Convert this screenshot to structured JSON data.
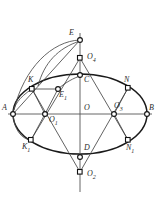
{
  "figure": {
    "background_color": "#ffffff",
    "stroke_color": "#1a1a1a",
    "width": 160,
    "height": 199,
    "center": {
      "x": 80,
      "y": 114
    },
    "ellipse": {
      "cx": 80,
      "cy": 114,
      "rx": 67,
      "ry": 40
    },
    "points": [
      {
        "id": "A",
        "label": "A",
        "sub": "",
        "x": 13,
        "y": 114,
        "marker": "circle",
        "label_x": 2,
        "label_y": 104
      },
      {
        "id": "B",
        "label": "B",
        "sub": "",
        "x": 147,
        "y": 114,
        "marker": "circle",
        "label_x": 149,
        "label_y": 104
      },
      {
        "id": "C",
        "label": "C",
        "sub": "",
        "x": 80,
        "y": 75,
        "marker": "circle",
        "label_x": 84,
        "label_y": 76
      },
      {
        "id": "D",
        "label": "D",
        "sub": "",
        "x": 80,
        "y": 157,
        "marker": "circle",
        "label_x": 84,
        "label_y": 144
      },
      {
        "id": "E",
        "label": "E",
        "sub": "",
        "x": 80,
        "y": 40,
        "marker": "circle",
        "label_x": 69,
        "label_y": 29
      },
      {
        "id": "E1",
        "label": "E",
        "sub": "1",
        "x": 58,
        "y": 89,
        "marker": "circle",
        "label_x": 59,
        "label_y": 91
      },
      {
        "id": "K",
        "label": "K",
        "sub": "",
        "x": 32,
        "y": 89,
        "marker": "square",
        "label_x": 28,
        "label_y": 76
      },
      {
        "id": "K1",
        "label": "K",
        "sub": "1",
        "x": 31,
        "y": 140,
        "marker": "square",
        "label_x": 22,
        "label_y": 143
      },
      {
        "id": "N",
        "label": "N",
        "sub": "",
        "x": 128,
        "y": 88,
        "marker": "square",
        "label_x": 124,
        "label_y": 76
      },
      {
        "id": "N1",
        "label": "N",
        "sub": "1",
        "x": 128,
        "y": 140,
        "marker": "square",
        "label_x": 126,
        "label_y": 144
      },
      {
        "id": "O",
        "label": "O",
        "sub": "",
        "x": 80,
        "y": 114,
        "marker": "none",
        "label_x": 84,
        "label_y": 104
      },
      {
        "id": "O1",
        "label": "O",
        "sub": "1",
        "x": 45,
        "y": 114,
        "marker": "circle",
        "label_x": 49,
        "label_y": 116
      },
      {
        "id": "O2",
        "label": "O",
        "sub": "2",
        "x": 80,
        "y": 172,
        "marker": "square",
        "label_x": 87,
        "label_y": 170
      },
      {
        "id": "O3",
        "label": "O",
        "sub": "3",
        "x": 114,
        "y": 114,
        "marker": "circle",
        "label_x": 114,
        "label_y": 102
      },
      {
        "id": "O4",
        "label": "O",
        "sub": "4",
        "x": 80,
        "y": 58,
        "marker": "square",
        "label_x": 87,
        "label_y": 53
      }
    ],
    "axes": [
      {
        "name": "major-axis",
        "x1": 8,
        "y1": 114,
        "x2": 152,
        "y2": 114
      },
      {
        "name": "minor-axis",
        "x1": 80,
        "y1": 33,
        "x2": 80,
        "y2": 192
      }
    ],
    "chords": [
      {
        "name": "A-to-E",
        "x1": 13,
        "y1": 114,
        "x2": 80,
        "y2": 40
      },
      {
        "name": "O4-to-K1",
        "x1": 80,
        "y1": 58,
        "x2": 31,
        "y2": 140
      },
      {
        "name": "O4-to-N1",
        "x1": 80,
        "y1": 58,
        "x2": 128,
        "y2": 140
      },
      {
        "name": "O2-to-K",
        "x1": 80,
        "y1": 172,
        "x2": 32,
        "y2": 89
      },
      {
        "name": "O2-to-N",
        "x1": 80,
        "y1": 172,
        "x2": 128,
        "y2": 88
      },
      {
        "name": "O1-to-K",
        "x1": 45,
        "y1": 114,
        "x2": 32,
        "y2": 89
      },
      {
        "name": "O1-to-K1",
        "x1": 45,
        "y1": 114,
        "x2": 31,
        "y2": 140
      },
      {
        "name": "O3-to-N",
        "x1": 114,
        "y1": 114,
        "x2": 128,
        "y2": 88
      },
      {
        "name": "O3-to-N1",
        "x1": 114,
        "y1": 114,
        "x2": 128,
        "y2": 140
      },
      {
        "name": "O4-to-C",
        "x1": 80,
        "y1": 58,
        "x2": 80,
        "y2": 75
      },
      {
        "name": "O1-to-E1",
        "x1": 45,
        "y1": 114,
        "x2": 58,
        "y2": 89
      }
    ],
    "arcs": [
      {
        "name": "arc-E-to-A",
        "d": "M 80 40 C 52 41 24 68 14 110"
      },
      {
        "name": "arc-E-to-K",
        "d": "M 80 41 C 58 48 44 63 38 86"
      },
      {
        "name": "arc-left-cap",
        "d": "M 32 89 C 18 98 14 106 13 114"
      },
      {
        "name": "arc-E1-top",
        "d": "M 58 89 C 66 82 74 78 80 76"
      }
    ],
    "small_arcs": [
      {
        "name": "arc-A-K-outer",
        "d": "M 13 114 C 14 99 21 90 32 89"
      },
      {
        "name": "arc-A-K1-outer",
        "d": "M 13 114 C 14 129 21 139 31 140"
      }
    ]
  }
}
